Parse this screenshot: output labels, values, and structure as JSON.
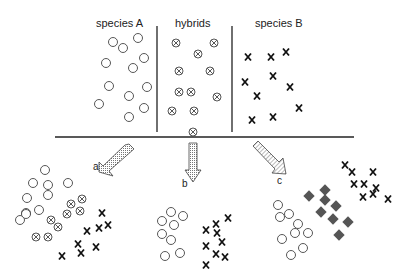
{
  "diagram": {
    "top_labels": {
      "species_a": "species A",
      "hybrids": "hybrids",
      "species_b": "species B"
    },
    "arrow_labels": {
      "a": "a",
      "b": "b",
      "c": "c"
    },
    "legend_semantics": {
      "circle": "species A individual",
      "crossed-circle": "hybrid individual",
      "x": "species B individual",
      "diamond": "new hybrid species individual"
    },
    "colors": {
      "ink": "#222222",
      "diamond": "#555555",
      "arrow_fill": "#bbbbbb"
    }
  }
}
